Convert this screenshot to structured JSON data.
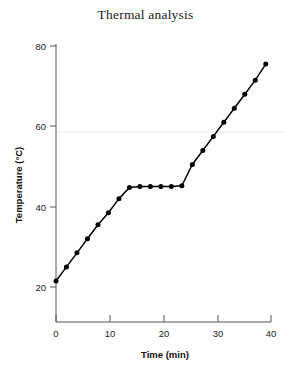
{
  "chart_data": {
    "type": "line",
    "title": "Thermal analysis",
    "xlabel": "Time (min)",
    "ylabel": "Temperature (°C)",
    "xlim": [
      0,
      41
    ],
    "ylim": [
      14,
      82
    ],
    "xticks": [
      0,
      10,
      20,
      30,
      40
    ],
    "yticks": [
      20,
      40,
      60,
      80
    ],
    "xtick_labels": [
      "0",
      "10",
      "20",
      "30",
      "40"
    ],
    "ytick_labels": [
      "20",
      "40",
      "60",
      "80"
    ],
    "grid": false,
    "legend": false,
    "marker": "filled-circle",
    "line_color": "#000000",
    "series": [
      {
        "name": "Heating curve",
        "x": [
          0,
          2,
          4,
          6,
          8,
          10,
          12,
          14,
          16,
          18,
          20,
          22,
          24,
          26,
          28,
          30,
          32,
          34,
          36,
          38,
          40
        ],
        "y": [
          21.5,
          25.0,
          28.5,
          32.0,
          35.5,
          38.5,
          42.0,
          44.8,
          45.0,
          45.0,
          45.0,
          45.0,
          45.2,
          50.5,
          54.0,
          57.5,
          61.0,
          64.5,
          68.0,
          71.5,
          75.5
        ]
      }
    ],
    "annotations": [
      "Initial linear heating from 21.5 °C",
      "Plateau near 45 °C between 14 and 25 min",
      "Steeper rise to 75.5 °C at 40 min"
    ]
  }
}
